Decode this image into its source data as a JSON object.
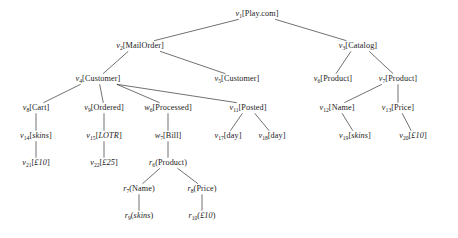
{
  "figure": {
    "type": "tree-diagram",
    "background": "#ffffff",
    "line_color": "#333333",
    "text_color": "#1a1a1a"
  },
  "nodes": [
    {
      "id": "v1",
      "var": "v",
      "sub": "1",
      "label": "Play.com",
      "bracket": "square",
      "italic_label": false,
      "x": 257,
      "y": 14
    },
    {
      "id": "v2",
      "var": "v",
      "sub": "2",
      "label": "MailOrder",
      "bracket": "square",
      "italic_label": false,
      "x": 140,
      "y": 46
    },
    {
      "id": "v3",
      "var": "v",
      "sub": "3",
      "label": "Catalog",
      "bracket": "square",
      "italic_label": false,
      "x": 358,
      "y": 46
    },
    {
      "id": "v4",
      "var": "v",
      "sub": "4",
      "label": "Customer",
      "bracket": "square",
      "italic_label": false,
      "x": 98,
      "y": 79
    },
    {
      "id": "v5",
      "var": "v",
      "sub": "5",
      "label": "Customer",
      "bracket": "square",
      "italic_label": false,
      "x": 237,
      "y": 79
    },
    {
      "id": "v6",
      "var": "v",
      "sub": "6",
      "label": "Product",
      "bracket": "square",
      "italic_label": false,
      "x": 333,
      "y": 79
    },
    {
      "id": "v7",
      "var": "v",
      "sub": "7",
      "label": "Product",
      "bracket": "square",
      "italic_label": false,
      "x": 398,
      "y": 79
    },
    {
      "id": "v8",
      "var": "v",
      "sub": "8",
      "label": "Cart",
      "bracket": "square",
      "italic_label": false,
      "x": 36,
      "y": 108
    },
    {
      "id": "v9",
      "var": "v",
      "sub": "9",
      "label": "Ordered",
      "bracket": "square",
      "italic_label": false,
      "x": 104,
      "y": 108
    },
    {
      "id": "w6",
      "var": "w",
      "sub": "6",
      "label": "Processed",
      "bracket": "square",
      "italic_label": false,
      "x": 168,
      "y": 108
    },
    {
      "id": "v11",
      "var": "v",
      "sub": "11",
      "label": "Posted",
      "bracket": "square",
      "italic_label": false,
      "x": 248,
      "y": 108
    },
    {
      "id": "v12",
      "var": "v",
      "sub": "12",
      "label": "Name",
      "bracket": "square",
      "italic_label": false,
      "x": 337,
      "y": 108
    },
    {
      "id": "v13",
      "var": "v",
      "sub": "13",
      "label": "Price",
      "bracket": "square",
      "italic_label": false,
      "x": 398,
      "y": 108
    },
    {
      "id": "v14",
      "var": "v",
      "sub": "14",
      "label": "skins",
      "bracket": "square",
      "italic_label": true,
      "x": 36,
      "y": 136
    },
    {
      "id": "v15",
      "var": "v",
      "sub": "15",
      "label": "LOTR",
      "bracket": "square",
      "italic_label": true,
      "x": 104,
      "y": 136
    },
    {
      "id": "w7",
      "var": "w",
      "sub": "7",
      "label": "Bill",
      "bracket": "square",
      "italic_label": false,
      "x": 168,
      "y": 136
    },
    {
      "id": "v17",
      "var": "v",
      "sub": "17",
      "label": "day",
      "bracket": "square",
      "italic_label": false,
      "x": 228,
      "y": 136
    },
    {
      "id": "v18",
      "var": "v",
      "sub": "18",
      "label": "day",
      "bracket": "square",
      "italic_label": false,
      "x": 272,
      "y": 136
    },
    {
      "id": "v19",
      "var": "v",
      "sub": "19",
      "label": "skins",
      "bracket": "square",
      "italic_label": true,
      "x": 355,
      "y": 136
    },
    {
      "id": "v20",
      "var": "v",
      "sub": "20",
      "label": "£10",
      "bracket": "square",
      "italic_label": true,
      "x": 413,
      "y": 136
    },
    {
      "id": "v21",
      "var": "v",
      "sub": "21",
      "label": "£10",
      "bracket": "square",
      "italic_label": true,
      "x": 36,
      "y": 163
    },
    {
      "id": "v22",
      "var": "v",
      "sub": "22",
      "label": "£25",
      "bracket": "square",
      "italic_label": true,
      "x": 104,
      "y": 163
    },
    {
      "id": "r6",
      "var": "r",
      "sub": "6",
      "label": "Product",
      "bracket": "round",
      "italic_label": false,
      "x": 168,
      "y": 163
    },
    {
      "id": "r7",
      "var": "r",
      "sub": "7",
      "label": "Name",
      "bracket": "round",
      "italic_label": false,
      "x": 139,
      "y": 189
    },
    {
      "id": "r8",
      "var": "r",
      "sub": "8",
      "label": "Price",
      "bracket": "round",
      "italic_label": false,
      "x": 202,
      "y": 189
    },
    {
      "id": "r9",
      "var": "r",
      "sub": "9",
      "label": "skins",
      "bracket": "round",
      "italic_label": true,
      "x": 139,
      "y": 216
    },
    {
      "id": "r10",
      "var": "r",
      "sub": "10",
      "label": "£10",
      "bracket": "round",
      "italic_label": true,
      "x": 202,
      "y": 216
    }
  ],
  "edges": [
    {
      "from": "v1",
      "to": "v2"
    },
    {
      "from": "v1",
      "to": "v3"
    },
    {
      "from": "v2",
      "to": "v4"
    },
    {
      "from": "v2",
      "to": "v5"
    },
    {
      "from": "v3",
      "to": "v6"
    },
    {
      "from": "v3",
      "to": "v7"
    },
    {
      "from": "v4",
      "to": "v8"
    },
    {
      "from": "v4",
      "to": "v9"
    },
    {
      "from": "v4",
      "to": "w6"
    },
    {
      "from": "v4",
      "to": "v11"
    },
    {
      "from": "v7",
      "to": "v12"
    },
    {
      "from": "v7",
      "to": "v13"
    },
    {
      "from": "v8",
      "to": "v14"
    },
    {
      "from": "v9",
      "to": "v15"
    },
    {
      "from": "w6",
      "to": "w7"
    },
    {
      "from": "v11",
      "to": "v17"
    },
    {
      "from": "v11",
      "to": "v18"
    },
    {
      "from": "v12",
      "to": "v19"
    },
    {
      "from": "v13",
      "to": "v20"
    },
    {
      "from": "v14",
      "to": "v21"
    },
    {
      "from": "v15",
      "to": "v22"
    },
    {
      "from": "w7",
      "to": "r6"
    },
    {
      "from": "r6",
      "to": "r7"
    },
    {
      "from": "r6",
      "to": "r8"
    },
    {
      "from": "r7",
      "to": "r9"
    },
    {
      "from": "r8",
      "to": "r10"
    }
  ]
}
